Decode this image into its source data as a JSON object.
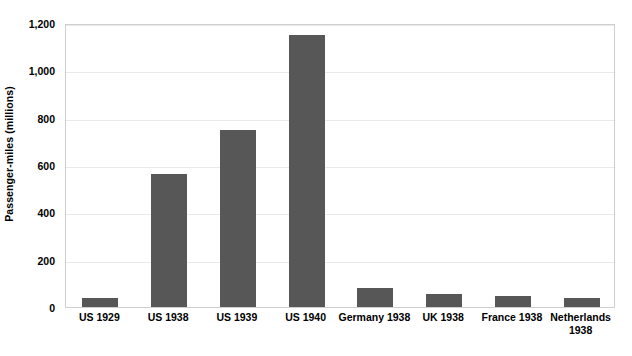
{
  "chart_data": {
    "type": "bar",
    "title": "",
    "subtitle": "",
    "xlabel": "",
    "ylabel": "Passenger-miles (millions)",
    "categories": [
      "US 1929",
      "US 1938",
      "US 1939",
      "US 1940",
      "Germany 1938",
      "UK 1938",
      "France 1938",
      "Netherlands 1938"
    ],
    "values": [
      40,
      560,
      750,
      1150,
      80,
      55,
      48,
      40
    ],
    "ylim": [
      0,
      1200
    ],
    "ytick_values": [
      0,
      200,
      400,
      600,
      800,
      1000,
      1200
    ],
    "ytick_labels": [
      "0",
      "200",
      "400",
      "600",
      "800",
      "1,000",
      "1,200"
    ],
    "grid": true,
    "legend": false,
    "legend_position": "none",
    "bar_color": "#575757",
    "grid_color": "#e9e9e9",
    "plot_border_color": "#cfcfcf",
    "background_color": "#ffffff"
  }
}
